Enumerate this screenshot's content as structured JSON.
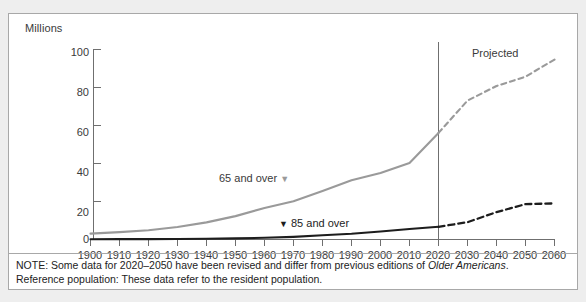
{
  "chart_data": {
    "type": "line",
    "title": "",
    "subtitle": "",
    "xlabel": "",
    "ylabel": "Millions",
    "axis_unit_label": "Millions",
    "xlim": [
      1900,
      2060
    ],
    "ylim": [
      0,
      100
    ],
    "grid": false,
    "legend_position": "inline-annotations",
    "x": [
      1900,
      1910,
      1920,
      1930,
      1940,
      1950,
      1960,
      1970,
      1980,
      1990,
      2000,
      2010,
      2020,
      2030,
      2040,
      2050,
      2060
    ],
    "xtick_labels": [
      "1900",
      "1910",
      "1920",
      "1930",
      "1940",
      "1950",
      "1960",
      "1970",
      "1980",
      "1990",
      "2000",
      "2010",
      "2020",
      "2030",
      "2040",
      "2050",
      "2060"
    ],
    "ytick_labels": [
      "0",
      "20",
      "40",
      "60",
      "80",
      "100"
    ],
    "ytick_values": [
      0,
      20,
      40,
      60,
      80,
      100
    ],
    "projection_start_year": 2020,
    "series": [
      {
        "name": "65 and over",
        "color": "#9a9a9a",
        "label": "65 and over",
        "label_marker": "▼",
        "label_marker_side": "right",
        "values": [
          3.1,
          3.9,
          4.9,
          6.6,
          9.0,
          12.3,
          16.6,
          20.1,
          25.5,
          31.2,
          35.0,
          40.3,
          56.1,
          73.1,
          80.8,
          85.7,
          94.7
        ]
      },
      {
        "name": "85 and over",
        "color": "#1d1d1d",
        "label": "85 and over",
        "label_marker": "▼",
        "label_marker_side": "left",
        "values": [
          0.1,
          0.2,
          0.2,
          0.3,
          0.4,
          0.6,
          0.9,
          1.4,
          2.2,
          3.0,
          4.2,
          5.5,
          6.7,
          9.1,
          14.4,
          18.6,
          19.0
        ]
      }
    ],
    "annotations": [
      {
        "name": "projected",
        "text": "Projected",
        "x": 2033,
        "y": 91
      }
    ]
  },
  "footnotes": {
    "note_prefix": "NOTE: Some data for 2020–2050 have been revised and differ from previous editions of ",
    "note_italic": "Older Americans",
    "note_suffix": ".",
    "reference_population": "Reference population: These data refer to the resident population."
  }
}
